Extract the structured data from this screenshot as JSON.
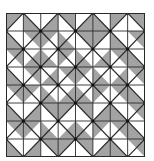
{
  "figure": {
    "rows": 8,
    "cols": 8,
    "colors": {
      "gray": "#a3a3a3",
      "white": "#ffffff",
      "line": "#2a2a2a",
      "vertex": "#111111"
    },
    "diagonal_rule": "slash when (row+col) even, backslash when odd",
    "gray_halves": [
      [
        "TL",
        "BL",
        "BR",
        "TR",
        "BR",
        "BL",
        "TL",
        "TR"
      ],
      [
        "BL",
        "TR",
        "TL",
        "BL",
        "TR",
        "TL",
        "BL",
        "TR"
      ],
      [
        "TR",
        "BR",
        "BL",
        "TL",
        "BL",
        "BR",
        "TR",
        "BL"
      ],
      [
        "BL",
        "TR",
        "BR",
        "TR",
        "TL",
        "BL",
        "BR",
        "TR"
      ],
      [
        "TR",
        "TL",
        "BL",
        "BR",
        "BL",
        "TL",
        "TR",
        "BL"
      ],
      [
        "BL",
        "BR",
        "TR",
        "TL",
        "TR",
        "BR",
        "BL",
        "TR"
      ],
      [
        "TR",
        "TL",
        "BL",
        "BR",
        "BL",
        "TL",
        "TR",
        "BL"
      ],
      [
        "BL",
        "BR",
        "TR",
        "TL",
        "TR",
        "BR",
        "BL",
        "TR"
      ]
    ]
  }
}
